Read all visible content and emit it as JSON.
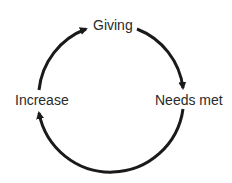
{
  "diagram": {
    "type": "cycle",
    "nodes": [
      {
        "id": "giving",
        "label": "Giving"
      },
      {
        "id": "needs_met",
        "label": "Needs met"
      },
      {
        "id": "increase",
        "label": "Increase"
      }
    ],
    "edges": [
      {
        "from": "giving",
        "to": "needs_met"
      },
      {
        "from": "needs_met",
        "to": "increase"
      },
      {
        "from": "increase",
        "to": "giving"
      }
    ],
    "stroke_color": "#1a1a1a"
  }
}
